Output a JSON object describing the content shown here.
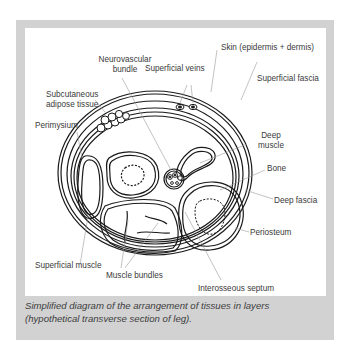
{
  "diagram": {
    "type": "anatomical cross-section",
    "subject": "hypothetical transverse section of leg",
    "labels": {
      "skin": "Skin (epidermis + dermis)",
      "neurovascular_line1": "Neurovascular",
      "neurovascular_line2": "bundle",
      "superficial_veins": "Superficial veins",
      "superficial_fascia": "Superficial fascia",
      "subcutaneous_line1": "Subcutaneous",
      "subcutaneous_line2": "adipose tissue",
      "perimysium": "Perimysium",
      "deep_muscle_line1": "Deep",
      "deep_muscle_line2": "muscle",
      "bone": "Bone",
      "deep_fascia": "Deep fascia",
      "superficial_muscle": "Superficial muscle",
      "periosteum": "Periosteum",
      "muscle_bundles": "Muscle bundles",
      "interosseous_septum": "Interosseous septum"
    },
    "colors": {
      "frame": "#d2d2d2",
      "panel": "#ffffff",
      "line": "#1a1a1a",
      "leader": "#9a9a9a",
      "text": "#3a3a3a"
    }
  },
  "caption": {
    "line1": "Simplified diagram of the arrangement of tissues in layers",
    "line2": "(hypothetical transverse section of leg)."
  }
}
